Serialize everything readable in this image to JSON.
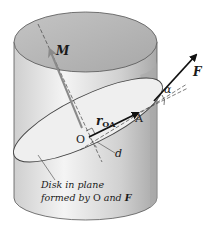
{
  "figure": {
    "labels": {
      "moment": "M",
      "force": "F",
      "angle": "α",
      "position_vector_main": "r",
      "position_vector_sub": "OA",
      "origin": "O",
      "point_a": "A",
      "distance": "d",
      "caption_line1": "Disk in plane",
      "caption_line2_prefix": "formed by ",
      "caption_line2_o": "O",
      "caption_line2_and": " and ",
      "caption_line2_f": "F"
    },
    "colors": {
      "cylinder_side": "#d9d9d9",
      "cylinder_top": "#b8b8b8",
      "disk_fill": "#ededed",
      "moment_arrow": "#8a8a8a",
      "force_arrow": "#111111",
      "outline": "#555555"
    }
  }
}
